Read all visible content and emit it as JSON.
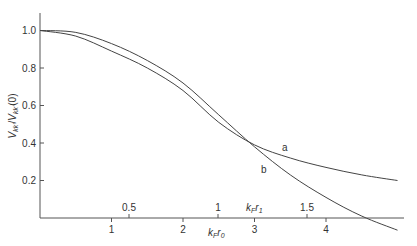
{
  "chart_data": {
    "type": "line",
    "title": "",
    "xlabel": "k_F r_0",
    "xlabel_secondary": "k_F r_1",
    "ylabel": "V_kk' / V_kk'(0)",
    "xlim": [
      0,
      5.1
    ],
    "ylim": [
      -0.07,
      1.1
    ],
    "x_ticks": [
      1,
      2,
      3,
      4
    ],
    "x_ticks_secondary": [
      0.5,
      1,
      1.5
    ],
    "y_ticks": [
      0.2,
      0.4,
      0.6,
      0.8,
      1.0
    ],
    "y_tick_labels": [
      "0.2",
      "0.4",
      "0.6",
      "0.8",
      "1.0"
    ],
    "grid": false,
    "legend": "inline labels on curves",
    "x": [
      0,
      0.5,
      1,
      1.5,
      2,
      2.5,
      3,
      3.5,
      4,
      4.5,
      5
    ],
    "series": [
      {
        "name": "a",
        "values": [
          1.0,
          0.97,
          0.89,
          0.8,
          0.68,
          0.51,
          0.39,
          0.32,
          0.27,
          0.23,
          0.2
        ]
      },
      {
        "name": "b",
        "values": [
          1.0,
          0.99,
          0.93,
          0.84,
          0.72,
          0.55,
          0.38,
          0.23,
          0.11,
          0.01,
          -0.065
        ]
      }
    ],
    "annotations": [
      {
        "text": "a",
        "x": 3.45,
        "y": 0.37
      },
      {
        "text": "b",
        "x": 3.15,
        "y": 0.25
      },
      {
        "text": "curves intersect",
        "x": 2.55,
        "y": 0.49
      }
    ]
  },
  "labels": {
    "y_axis": "V_kk'/V_kk'(0)",
    "x_axis_primary": "k_F r_0",
    "x_axis_secondary": "k_F r_1",
    "curve_a": "a",
    "curve_b": "b"
  }
}
